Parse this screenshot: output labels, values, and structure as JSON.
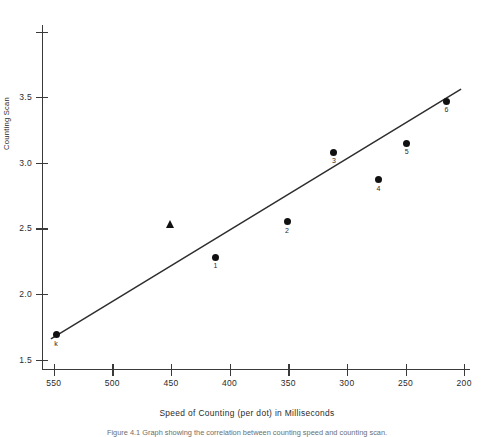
{
  "figure": {
    "caption": "Figure 4.1  Graph showing the correlation between counting speed and counting scan."
  },
  "chart_data": {
    "type": "scatter",
    "title": "",
    "xlabel": "Speed of Counting (per dot) in Milliseconds",
    "ylabel": "Counting Scan",
    "xlim": [
      560,
      195
    ],
    "ylim": [
      1.42,
      4.05
    ],
    "x_reversed": true,
    "grid": false,
    "legend": "none",
    "xticks": [
      550,
      500,
      450,
      400,
      350,
      300,
      250,
      200
    ],
    "xtick_labels": [
      "550",
      "500",
      "450",
      "400",
      "350",
      "300",
      "250",
      "200"
    ],
    "yticks": [
      1.5,
      2.0,
      2.5,
      3.0,
      3.5,
      4.0
    ],
    "ytick_labels": [
      "1.5",
      "2.0",
      "2.5",
      "3.0",
      "3.5",
      ""
    ],
    "points": [
      {
        "label": "k",
        "x": 548,
        "y": 1.69,
        "marker": "circle"
      },
      {
        "label": "1",
        "x": 412,
        "y": 2.28,
        "marker": "circle"
      },
      {
        "label": "2",
        "x": 351,
        "y": 2.55,
        "marker": "circle"
      },
      {
        "label": "3",
        "x": 311,
        "y": 3.08,
        "marker": "circle"
      },
      {
        "label": "4",
        "x": 273,
        "y": 2.87,
        "marker": "circle"
      },
      {
        "label": "5",
        "x": 249,
        "y": 3.15,
        "marker": "circle"
      },
      {
        "label": "6",
        "x": 215,
        "y": 3.47,
        "marker": "circle"
      },
      {
        "label": "",
        "x": 450,
        "y": 2.53,
        "marker": "triangle"
      }
    ],
    "fit_line": {
      "type": "linear-regression",
      "x_start": 552,
      "y_start": 1.66,
      "x_end": 203,
      "y_end": 3.56
    }
  }
}
